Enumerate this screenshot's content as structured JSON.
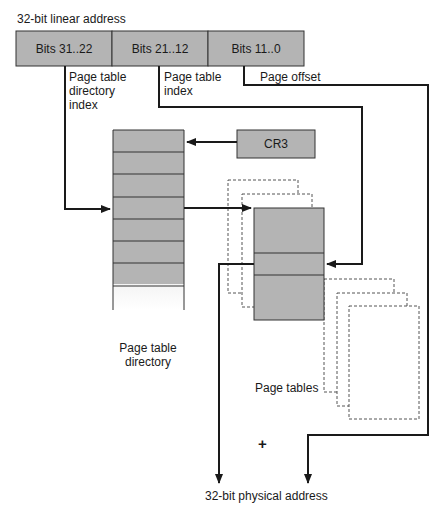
{
  "title": "32-bit linear address",
  "linear_address": {
    "fields": [
      {
        "label": "Bits 31..22",
        "caption": [
          "Page table",
          "directory",
          "index"
        ]
      },
      {
        "label": "Bits 21..12",
        "caption": [
          "Page table",
          "index"
        ]
      },
      {
        "label": "Bits 11..0",
        "caption": [
          "Page offset"
        ]
      }
    ]
  },
  "cr3": {
    "label": "CR3"
  },
  "directory": {
    "label": [
      "Page table",
      "directory"
    ],
    "rows": 8
  },
  "page_tables": {
    "label": "Page tables"
  },
  "operator": "+",
  "output": {
    "label": "32-bit physical address"
  },
  "colors": {
    "box_fill": "#b4b4b4",
    "line": "#1a1a1a",
    "dashed": "#555555"
  }
}
